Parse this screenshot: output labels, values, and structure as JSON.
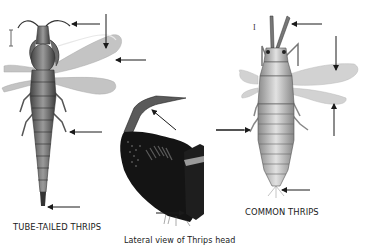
{
  "figure": {
    "captions": {
      "tube_tailed": "TUBE-TAILED THRIPS",
      "lateral_view": "Lateral view of Thrips head",
      "common": "COMMON THRIPS"
    },
    "scale_bar_labels": {
      "common": "I"
    },
    "specimens": [
      {
        "id": "tube-tailed-thrips",
        "view": "dorsal",
        "pointer_arrows": 6
      },
      {
        "id": "thrips-head",
        "view": "lateral",
        "pointer_arrows": 3
      },
      {
        "id": "common-thrips",
        "view": "dorsal",
        "pointer_arrows": 5
      }
    ],
    "colors": {
      "ink": "#1a1a1a",
      "wing": "#bdbdbd",
      "body": "#6e6e6e",
      "head_lateral": "#121212",
      "background": "#ffffff"
    }
  }
}
